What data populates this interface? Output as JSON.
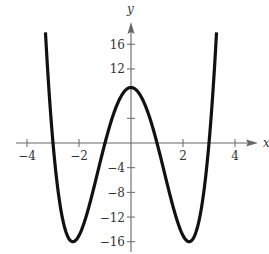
{
  "chart_data": {
    "type": "line",
    "title": "",
    "xlabel": "x",
    "ylabel": "y",
    "function": "f(x) = x^4 - 10x^2 + 9",
    "xlim": [
      -4.0,
      4.8
    ],
    "ylim": [
      -17.5,
      19.5
    ],
    "grid": false,
    "legend": null,
    "x_ticks": [
      -4,
      -2,
      2,
      4
    ],
    "x_tick_labels": [
      "−4",
      "−2",
      "2",
      "4"
    ],
    "y_ticks": [
      -16,
      -12,
      -8,
      -4,
      4,
      12,
      16
    ],
    "y_tick_labels": [
      "−16",
      "−12",
      "−8",
      "−4",
      "",
      "12",
      "16"
    ],
    "series": [
      {
        "name": "f(x)",
        "color": "#111111",
        "x": [
          -3.29,
          -3.0,
          -2.5,
          -2.236,
          -2.0,
          -1.5,
          -1.0,
          -0.5,
          0.0,
          0.5,
          1.0,
          1.5,
          2.0,
          2.236,
          2.5,
          3.0,
          3.29
        ],
        "y": [
          18.0,
          0.0,
          -12.44,
          -16.0,
          -15.0,
          -8.44,
          0.0,
          6.56,
          9.0,
          6.56,
          0.0,
          -8.44,
          -15.0,
          -16.0,
          -12.44,
          0.0,
          18.0
        ]
      }
    ],
    "key_points": {
      "local_max": [
        0,
        9
      ],
      "local_mins": [
        [
          -2.236,
          -16
        ],
        [
          2.236,
          -16
        ]
      ],
      "x_intercepts": [
        -3,
        -1,
        1,
        3
      ]
    }
  },
  "axes": {
    "x_label": "x",
    "y_label": "y"
  }
}
